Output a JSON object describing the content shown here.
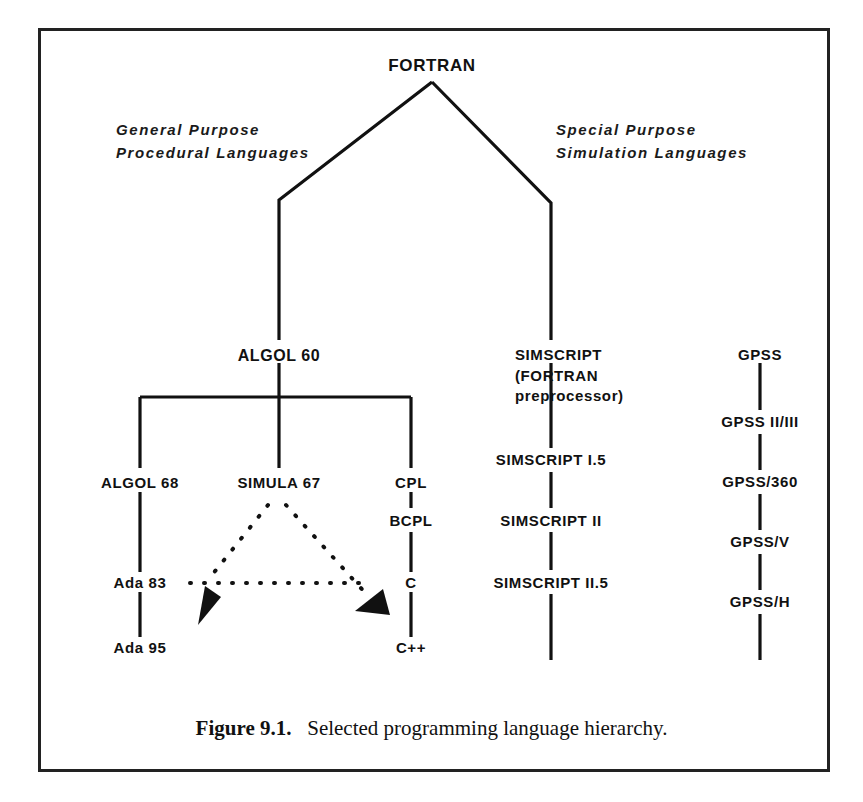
{
  "figure": {
    "caption_number": "Figure 9.1.",
    "caption_text": "Selected programming language hierarchy.",
    "border_color": "#222222",
    "line_color": "#111111"
  },
  "branch_labels": {
    "left": "General Purpose\nProcedural Languages",
    "right": "Special Purpose\nSimulation Languages"
  },
  "root": {
    "label": "FORTRAN"
  },
  "columns": {
    "algol": {
      "root_label": "ALGOL 60",
      "children": [
        {
          "label": "ALGOL 68"
        },
        {
          "label": "SIMULA 67"
        },
        {
          "label": "CPL"
        }
      ]
    },
    "ada_chain": [
      {
        "label": "ALGOL 68"
      },
      {
        "label": "Ada 83"
      },
      {
        "label": "Ada 95"
      }
    ],
    "c_chain": [
      {
        "label": "CPL"
      },
      {
        "label": "BCPL"
      },
      {
        "label": "C"
      },
      {
        "label": "C++"
      }
    ],
    "simula_chain": [
      {
        "label": "SIMULA 67"
      }
    ],
    "simscript_chain": [
      {
        "label": "SIMSCRIPT\n(FORTRAN\npreprocessor)"
      },
      {
        "label": "SIMSCRIPT I.5"
      },
      {
        "label": "SIMSCRIPT II"
      },
      {
        "label": "SIMSCRIPT II.5"
      }
    ],
    "gpss_chain": [
      {
        "label": "GPSS"
      },
      {
        "label": "GPSS II/III"
      },
      {
        "label": "GPSS/360"
      },
      {
        "label": "GPSS/V"
      },
      {
        "label": "GPSS/H"
      }
    ]
  }
}
